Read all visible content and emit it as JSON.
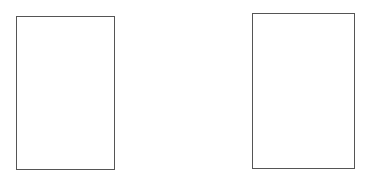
{
  "canvas": {
    "width": 366,
    "height": 179,
    "background": "#ffffff"
  },
  "panels": [
    {
      "id": "left",
      "x": 16,
      "y": 16,
      "width": 99,
      "height": 154,
      "border_color": "#555555",
      "fill": "#ffffff",
      "label": ""
    },
    {
      "id": "right",
      "x": 252,
      "y": 13,
      "width": 103,
      "height": 156,
      "border_color": "#555555",
      "fill": "#ffffff",
      "label": ""
    }
  ]
}
